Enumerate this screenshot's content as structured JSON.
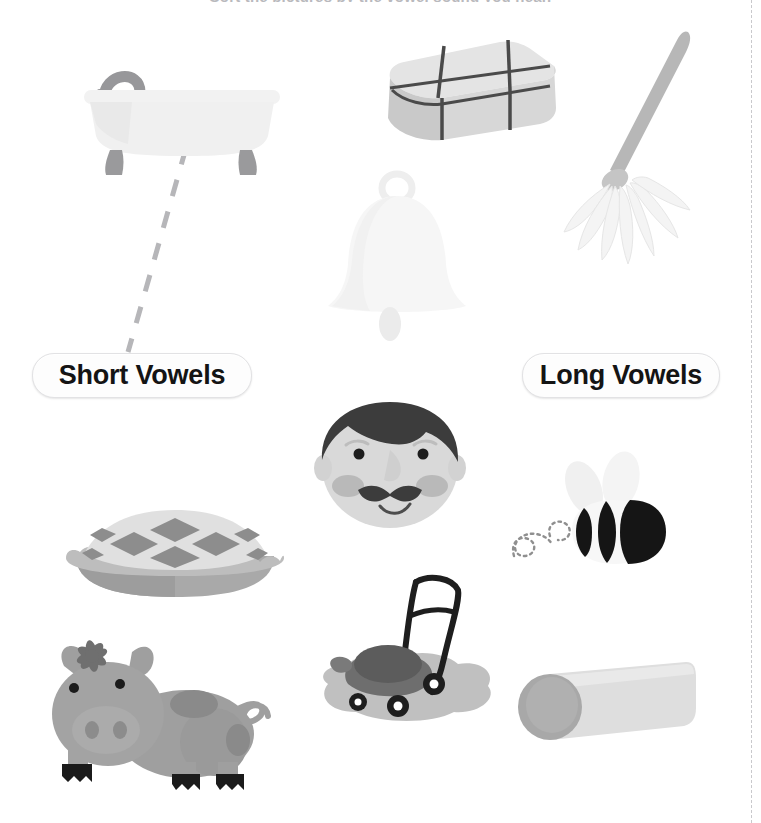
{
  "worksheet": {
    "title_sliver": "Sort the pictures by the vowel sound you hear.",
    "categories": {
      "short_label": "Short Vowels",
      "long_label": "Long Vowels"
    },
    "cut_line_label": "cut-guide"
  },
  "pictures": [
    {
      "id": "tub",
      "name": "bathtub",
      "word": "tub",
      "vowel": "short",
      "x": 82,
      "y": 44,
      "w": 200,
      "h": 135
    },
    {
      "id": "box",
      "name": "gift-box",
      "word": "box",
      "vowel": "short",
      "x": 382,
      "y": 32,
      "w": 180,
      "h": 115
    },
    {
      "id": "mop",
      "name": "mop",
      "word": "mop",
      "vowel": "short",
      "x": 560,
      "y": 28,
      "w": 160,
      "h": 262
    },
    {
      "id": "bell",
      "name": "bell",
      "word": "bell",
      "vowel": "short",
      "x": 322,
      "y": 172,
      "w": 150,
      "h": 175
    },
    {
      "id": "man",
      "name": "man-face",
      "word": "man",
      "vowel": "short",
      "x": 314,
      "y": 398,
      "w": 152,
      "h": 135
    },
    {
      "id": "pie",
      "name": "pie",
      "word": "pie",
      "vowel": "long",
      "x": 62,
      "y": 498,
      "w": 226,
      "h": 102
    },
    {
      "id": "bee",
      "name": "bee",
      "word": "bee",
      "vowel": "long",
      "x": 506,
      "y": 452,
      "w": 170,
      "h": 122
    },
    {
      "id": "pig",
      "name": "pig",
      "word": "pig",
      "vowel": "short",
      "x": 54,
      "y": 622,
      "w": 228,
      "h": 172
    },
    {
      "id": "mower",
      "name": "lawn-mower",
      "word": "mower",
      "vowel": "long",
      "x": 312,
      "y": 572,
      "w": 188,
      "h": 158
    },
    {
      "id": "log",
      "name": "log",
      "word": "log",
      "vowel": "short",
      "x": 500,
      "y": 660,
      "w": 196,
      "h": 92
    }
  ],
  "connections": [
    {
      "from": "tub",
      "to": "short_label",
      "x1": 186,
      "y1": 148,
      "x2": 128,
      "y2": 352,
      "style": "dashed"
    }
  ],
  "colors": {
    "page_background": "#ffffff",
    "pill_fill": "#fdfdfd",
    "pill_border": "#e2e2e4",
    "pill_text": "#141414",
    "connector": "#b6b6b9",
    "cut_line": "#c9c9cc",
    "tub_body": "#f0f0f0",
    "tub_foot": "#9a9a9c",
    "box_fill": "#d5d5d5",
    "box_ribbon": "#4a4a4a",
    "mop_handle": "#b7b7b7",
    "mop_strands": "#f4f4f4",
    "bell_fill": "#f6f6f6",
    "face_skin": "#d9d9d9",
    "face_hair": "#3c3c3c",
    "face_cheek": "#b9b9b9",
    "pie_crust": "#a9a9a9",
    "pie_lattice": "#e0e0e0",
    "pie_filling": "#8d8d8d",
    "bee_body": "#f7f7f7",
    "bee_stripe": "#151515",
    "pig_body": "#9f9f9f",
    "pig_spot": "#8a8a8a",
    "pig_hoof": "#1b1b1b",
    "mower_body": "#6e6e6e",
    "mower_grass": "#b5b5b5",
    "mower_wheel": "#1e1e1e",
    "log_body": "#dedede",
    "log_end": "#a8a8a8"
  }
}
